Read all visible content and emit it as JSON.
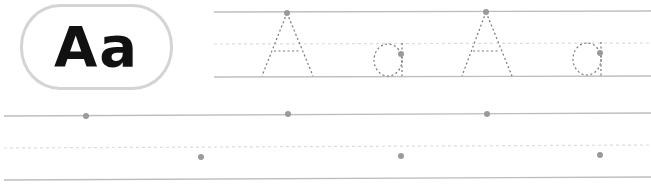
{
  "worksheet": {
    "letter_badge": {
      "text": "Aa"
    },
    "colors": {
      "guide_line": "#bdbdbd",
      "dashed_line": "#d9d9d9",
      "trace_stroke": "#8a8a8a",
      "start_dot": "#9a9a9a",
      "badge_border": "#d4d4d4"
    },
    "trace_row": {
      "letters": [
        "A",
        "a",
        "A",
        "a"
      ]
    },
    "practice_row": {
      "start_dots": 6
    }
  }
}
